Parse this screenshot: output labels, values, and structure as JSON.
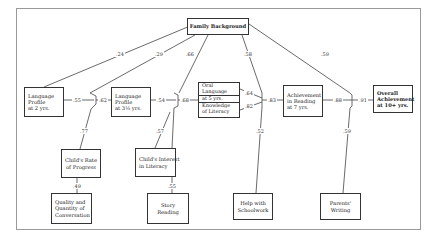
{
  "diagram": {
    "type": "path-diagram",
    "nodes": {
      "family_background": {
        "label": "Family Background"
      },
      "language_profile_2": {
        "lines": [
          "Language",
          "Profile",
          "at 2 yrs."
        ]
      },
      "language_profile_3": {
        "lines": [
          "Language",
          "Profile",
          "at 3½ yrs."
        ]
      },
      "oral_language": {
        "lines": [
          "Oral",
          "Language"
        ]
      },
      "at_5_yrs": {
        "label": "at 5 yrs."
      },
      "knowledge_literacy": {
        "lines": [
          "Knowledge",
          "of Literacy"
        ]
      },
      "achievement_reading": {
        "lines": [
          "Achievement",
          "in Reading",
          "at 7 yrs."
        ]
      },
      "overall_achievement": {
        "lines": [
          "Overall",
          "Achievement",
          "at 10+ yrs."
        ]
      },
      "childs_rate": {
        "lines": [
          "Child's Rate",
          "of Progress"
        ]
      },
      "quality_conversation": {
        "lines": [
          "Quality and",
          "Quantity of",
          "Conversation"
        ]
      },
      "childs_interest": {
        "lines": [
          "Child's Interest",
          "in Literacy"
        ]
      },
      "story_reading": {
        "lines": [
          "Story",
          "Reading"
        ]
      },
      "help_schoolwork": {
        "lines": [
          "Help with",
          "Schoolwork"
        ]
      },
      "parents_writing": {
        "lines": [
          "Parents'",
          "Writing"
        ]
      }
    },
    "coefficients": {
      "fb_to_lp2": ".24",
      "fb_to_lp3": ".29",
      "fb_to_interest": ".66",
      "fb_to_reading": ".58",
      "fb_to_overall": ".59",
      "lp2_to_lp3": ".55",
      "lp3_junction_out": ".62",
      "lp3_to_5yrs": ".54",
      "5yrs_junction_out": ".68",
      "oral_to_reading": ".64",
      "knowledge_to_reading": ".82",
      "reading_junction_out": ".83",
      "reading_to_overall": ".88",
      "overall_junction_out": ".91",
      "rate_to_lp3": ".77",
      "quality_to_rate": ".49",
      "interest_to_5yrs": ".57",
      "story_to_interest": ".55",
      "help_to_reading": ".52",
      "writing_to_overall": ".59"
    }
  }
}
